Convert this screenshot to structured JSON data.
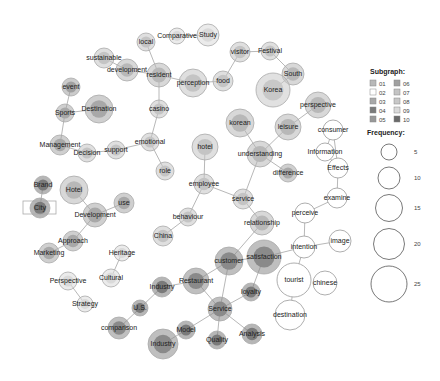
{
  "colors": {
    "sg01": "#b8b8b8",
    "sg02": "#ffffff",
    "sg03": "#a8a8a8",
    "sg04": "#7a7a7a",
    "sg05": "#989898",
    "sg06": "#a0a0a0",
    "sg07": "#c4c4c4",
    "sg08": "#c8c8c8",
    "sg09": "#dadada",
    "sg10": "#6a6a6a"
  },
  "legend": {
    "subgraph_title": "Subgraph:",
    "subgraphs": [
      {
        "id": "01",
        "color": "#b8b8b8"
      },
      {
        "id": "02",
        "color": "#ffffff"
      },
      {
        "id": "03",
        "color": "#a8a8a8"
      },
      {
        "id": "04",
        "color": "#7a7a7a"
      },
      {
        "id": "05",
        "color": "#989898"
      },
      {
        "id": "06",
        "color": "#a0a0a0"
      },
      {
        "id": "07",
        "color": "#c4c4c4"
      },
      {
        "id": "08",
        "color": "#c8c8c8"
      },
      {
        "id": "09",
        "color": "#dadada"
      },
      {
        "id": "10",
        "color": "#6a6a6a"
      }
    ],
    "frequency_title": "Frequency:",
    "frequencies": [
      {
        "label": "5",
        "r": 8
      },
      {
        "label": "10",
        "r": 11
      },
      {
        "label": "15",
        "r": 13.5
      },
      {
        "label": "20",
        "r": 15.5
      },
      {
        "label": "25",
        "r": 18
      }
    ]
  },
  "nodes": [
    {
      "id": "local",
      "label": "local",
      "x": 146,
      "y": 42,
      "r": 9,
      "c": "#c4c4c4"
    },
    {
      "id": "comparative",
      "label": "Comparative",
      "x": 177,
      "y": 36,
      "r": 8,
      "c": "#dadada"
    },
    {
      "id": "study",
      "label": "Study",
      "x": 208,
      "y": 35,
      "r": 11,
      "c": "#dadada"
    },
    {
      "id": "sustainable",
      "label": "sustainable",
      "x": 104,
      "y": 58,
      "r": 10,
      "c": "#c4c4c4"
    },
    {
      "id": "development1",
      "label": "development",
      "x": 127,
      "y": 70,
      "r": 11,
      "c": "#b8b8b8"
    },
    {
      "id": "resident",
      "label": "resident",
      "x": 159,
      "y": 75,
      "r": 12,
      "c": "#b8b8b8"
    },
    {
      "id": "perception",
      "label": "perception",
      "x": 193,
      "y": 83,
      "r": 14,
      "c": "#c4c4c4"
    },
    {
      "id": "food",
      "label": "food",
      "x": 223,
      "y": 81,
      "r": 10,
      "c": "#c4c4c4"
    },
    {
      "id": "visitor",
      "label": "visitor",
      "x": 240,
      "y": 52,
      "r": 10,
      "c": "#c4c4c4"
    },
    {
      "id": "festival",
      "label": "Festival",
      "x": 270,
      "y": 51,
      "r": 9,
      "c": "#c4c4c4"
    },
    {
      "id": "south",
      "label": "South",
      "x": 293,
      "y": 74,
      "r": 11,
      "c": "#b8b8b8"
    },
    {
      "id": "korea",
      "label": "Korea",
      "x": 273,
      "y": 90,
      "r": 17,
      "c": "#c8c8c8"
    },
    {
      "id": "event",
      "label": "event",
      "x": 71,
      "y": 87,
      "r": 9,
      "c": "#a0a0a0"
    },
    {
      "id": "sports",
      "label": "Sports",
      "x": 65,
      "y": 113,
      "r": 9,
      "c": "#a8a8a8"
    },
    {
      "id": "destination1",
      "label": "Destination",
      "x": 99,
      "y": 109,
      "r": 14,
      "c": "#a8a8a8"
    },
    {
      "id": "casino",
      "label": "casino",
      "x": 159,
      "y": 109,
      "r": 9,
      "c": "#c4c4c4"
    },
    {
      "id": "emotional",
      "label": "emotional",
      "x": 150,
      "y": 142,
      "r": 9,
      "c": "#c4c4c4"
    },
    {
      "id": "support",
      "label": "support",
      "x": 116,
      "y": 150,
      "r": 9,
      "c": "#c4c4c4"
    },
    {
      "id": "decision",
      "label": "Decision",
      "x": 87,
      "y": 153,
      "r": 9,
      "c": "#c4c4c4"
    },
    {
      "id": "management",
      "label": "Management",
      "x": 60,
      "y": 145,
      "r": 10,
      "c": "#a8a8a8"
    },
    {
      "id": "role",
      "label": "role",
      "x": 165,
      "y": 171,
      "r": 9,
      "c": "#c4c4c4"
    },
    {
      "id": "perspective1",
      "label": "perspective",
      "x": 318,
      "y": 105,
      "r": 13,
      "c": "#b8b8b8"
    },
    {
      "id": "korean",
      "label": "korean",
      "x": 240,
      "y": 123,
      "r": 14,
      "c": "#b8b8b8"
    },
    {
      "id": "leisure",
      "label": "leisure",
      "x": 288,
      "y": 127,
      "r": 13,
      "c": "#b8b8b8"
    },
    {
      "id": "understanding",
      "label": "understanding",
      "x": 260,
      "y": 154,
      "r": 13,
      "c": "#b8b8b8"
    },
    {
      "id": "difference",
      "label": "difference",
      "x": 288,
      "y": 173,
      "r": 9,
      "c": "#a8a8a8"
    },
    {
      "id": "consumer",
      "label": "consumer",
      "x": 333,
      "y": 130,
      "r": 10,
      "c": "#ffffff"
    },
    {
      "id": "information",
      "label": "Information",
      "x": 325,
      "y": 152,
      "r": 9,
      "c": "#ffffff"
    },
    {
      "id": "effects",
      "label": "Effects",
      "x": 338,
      "y": 168,
      "r": 10,
      "c": "#ffffff"
    },
    {
      "id": "hotel1",
      "label": "hotel",
      "x": 205,
      "y": 147,
      "r": 13,
      "c": "#c4c4c4"
    },
    {
      "id": "employee",
      "label": "employee",
      "x": 204,
      "y": 184,
      "r": 10,
      "c": "#c4c4c4"
    },
    {
      "id": "service1",
      "label": "service",
      "x": 243,
      "y": 199,
      "r": 10,
      "c": "#c4c4c4"
    },
    {
      "id": "behaviour",
      "label": "behaviour",
      "x": 188,
      "y": 217,
      "r": 9,
      "c": "#c4c4c4"
    },
    {
      "id": "china",
      "label": "China",
      "x": 163,
      "y": 236,
      "r": 10,
      "c": "#c4c4c4"
    },
    {
      "id": "relationship",
      "label": "relationship",
      "x": 262,
      "y": 223,
      "r": 12,
      "c": "#b8b8b8"
    },
    {
      "id": "examine",
      "label": "examine",
      "x": 337,
      "y": 198,
      "r": 10,
      "c": "#ffffff"
    },
    {
      "id": "perceive",
      "label": "perceive",
      "x": 305,
      "y": 213,
      "r": 10,
      "c": "#ffffff"
    },
    {
      "id": "intention",
      "label": "intention",
      "x": 304,
      "y": 247,
      "r": 11,
      "c": "#ffffff"
    },
    {
      "id": "image",
      "label": "image",
      "x": 340,
      "y": 241,
      "r": 11,
      "c": "#ffffff"
    },
    {
      "id": "tourist",
      "label": "tourist",
      "x": 294,
      "y": 280,
      "r": 17,
      "c": "#ffffff"
    },
    {
      "id": "chinese",
      "label": "chinese",
      "x": 325,
      "y": 283,
      "r": 12,
      "c": "#ffffff"
    },
    {
      "id": "destination2",
      "label": "destination",
      "x": 290,
      "y": 315,
      "r": 15,
      "c": "#ffffff"
    },
    {
      "id": "brand",
      "label": "Brand",
      "x": 43,
      "y": 185,
      "r": 9,
      "c": "#7a7a7a"
    },
    {
      "id": "city",
      "label": "City",
      "x": 40,
      "y": 208,
      "r": 10,
      "c": "#7a7a7a"
    },
    {
      "id": "hotel2",
      "label": "Hotel",
      "x": 74,
      "y": 190,
      "r": 14,
      "c": "#b8b8b8"
    },
    {
      "id": "use",
      "label": "use",
      "x": 124,
      "y": 203,
      "r": 10,
      "c": "#a8a8a8"
    },
    {
      "id": "development2",
      "label": "Development",
      "x": 95,
      "y": 215,
      "r": 12,
      "c": "#a8a8a8"
    },
    {
      "id": "approach",
      "label": "Approach",
      "x": 73,
      "y": 241,
      "r": 10,
      "c": "#a8a8a8"
    },
    {
      "id": "marketing",
      "label": "Marketing",
      "x": 49,
      "y": 253,
      "r": 10,
      "c": "#a8a8a8"
    },
    {
      "id": "heritage",
      "label": "Heritage",
      "x": 122,
      "y": 253,
      "r": 8,
      "c": "#dadada"
    },
    {
      "id": "cultural",
      "label": "Cultural",
      "x": 111,
      "y": 278,
      "r": 9,
      "c": "#dadada"
    },
    {
      "id": "perspective2",
      "label": "Perspective",
      "x": 68,
      "y": 281,
      "r": 9,
      "c": "#dadada"
    },
    {
      "id": "strategy",
      "label": "Strategy",
      "x": 85,
      "y": 304,
      "r": 8,
      "c": "#dadada"
    },
    {
      "id": "customer",
      "label": "customer",
      "x": 229,
      "y": 261,
      "r": 14,
      "c": "#8a8a8a"
    },
    {
      "id": "satisfaction",
      "label": "satisfaction",
      "x": 264,
      "y": 257,
      "r": 17,
      "c": "#8a8a8a"
    },
    {
      "id": "restaurant",
      "label": "Restaurant",
      "x": 196,
      "y": 281,
      "r": 13,
      "c": "#8a8a8a"
    },
    {
      "id": "industry1",
      "label": "Industry",
      "x": 162,
      "y": 287,
      "r": 10,
      "c": "#7a7a7a"
    },
    {
      "id": "loyalty",
      "label": "loyalty",
      "x": 251,
      "y": 292,
      "r": 9,
      "c": "#7a7a7a"
    },
    {
      "id": "us",
      "label": "U.S.",
      "x": 140,
      "y": 308,
      "r": 8,
      "c": "#7a7a7a"
    },
    {
      "id": "service2",
      "label": "Service",
      "x": 220,
      "y": 309,
      "r": 12,
      "c": "#8a8a8a"
    },
    {
      "id": "comparison",
      "label": "comparison",
      "x": 119,
      "y": 328,
      "r": 11,
      "c": "#8a8a8a"
    },
    {
      "id": "model",
      "label": "Model",
      "x": 186,
      "y": 330,
      "r": 9,
      "c": "#7a7a7a"
    },
    {
      "id": "analysis",
      "label": "Analysis",
      "x": 252,
      "y": 334,
      "r": 10,
      "c": "#7a7a7a"
    },
    {
      "id": "quality",
      "label": "Quality",
      "x": 217,
      "y": 340,
      "r": 9,
      "c": "#7a7a7a"
    },
    {
      "id": "industry2",
      "label": "Industry",
      "x": 163,
      "y": 344,
      "r": 15,
      "c": "#8a8a8a"
    }
  ],
  "edges": [
    [
      "local",
      "resident"
    ],
    [
      "comparative",
      "study"
    ],
    [
      "sustainable",
      "development1"
    ],
    [
      "development1",
      "resident"
    ],
    [
      "resident",
      "perception"
    ],
    [
      "resident",
      "casino"
    ],
    [
      "perception",
      "food"
    ],
    [
      "food",
      "visitor"
    ],
    [
      "visitor",
      "festival"
    ],
    [
      "festival",
      "south"
    ],
    [
      "south",
      "korea"
    ],
    [
      "event",
      "sports"
    ],
    [
      "sports",
      "destination1"
    ],
    [
      "sports",
      "management"
    ],
    [
      "casino",
      "emotional"
    ],
    [
      "emotional",
      "support"
    ],
    [
      "emotional",
      "role"
    ],
    [
      "support",
      "decision"
    ],
    [
      "decision",
      "management"
    ],
    [
      "perspective1",
      "leisure"
    ],
    [
      "korean",
      "understanding"
    ],
    [
      "leisure",
      "understanding"
    ],
    [
      "understanding",
      "difference"
    ],
    [
      "understanding",
      "service1"
    ],
    [
      "consumer",
      "information"
    ],
    [
      "consumer",
      "effects"
    ],
    [
      "information",
      "effects"
    ],
    [
      "effects",
      "examine"
    ],
    [
      "hotel1",
      "employee"
    ],
    [
      "employee",
      "service1"
    ],
    [
      "employee",
      "behaviour"
    ],
    [
      "behaviour",
      "china"
    ],
    [
      "service1",
      "relationship"
    ],
    [
      "examine",
      "perceive"
    ],
    [
      "perceive",
      "intention"
    ],
    [
      "intention",
      "image"
    ],
    [
      "intention",
      "tourist"
    ],
    [
      "intention",
      "satisfaction"
    ],
    [
      "tourist",
      "destination2"
    ],
    [
      "relationship",
      "customer"
    ],
    [
      "brand",
      "city"
    ],
    [
      "hotel2",
      "development2"
    ],
    [
      "use",
      "development2"
    ],
    [
      "development2",
      "approach"
    ],
    [
      "approach",
      "marketing"
    ],
    [
      "heritage",
      "cultural"
    ],
    [
      "perspective2",
      "strategy"
    ],
    [
      "customer",
      "satisfaction"
    ],
    [
      "customer",
      "restaurant"
    ],
    [
      "customer",
      "service2"
    ],
    [
      "satisfaction",
      "loyalty"
    ],
    [
      "restaurant",
      "industry1"
    ],
    [
      "restaurant",
      "service2"
    ],
    [
      "industry1",
      "us"
    ],
    [
      "us",
      "comparison"
    ],
    [
      "loyalty",
      "service2"
    ],
    [
      "service2",
      "model"
    ],
    [
      "service2",
      "quality"
    ],
    [
      "service2",
      "analysis"
    ],
    [
      "model",
      "industry2"
    ]
  ],
  "selection_box": {
    "x": 23,
    "y": 201,
    "w": 33,
    "h": 13
  }
}
